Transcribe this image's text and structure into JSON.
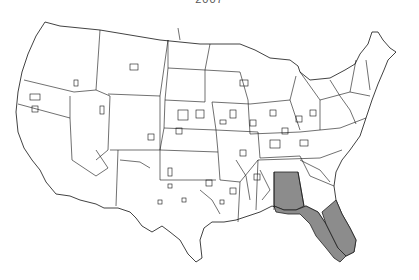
{
  "title": "2007",
  "map": {
    "subject": "United States county-level map",
    "base_fill": "#ffffff",
    "border_color": "#111111",
    "highlight_color": "#8c8c8c",
    "highlighted_regions": [
      "Alabama (southern portion)",
      "Florida",
      "Southwest Georgia border counties"
    ]
  }
}
